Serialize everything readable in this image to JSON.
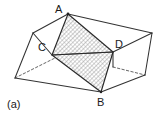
{
  "figure": {
    "panel_label": "(a)",
    "caption_text": "",
    "background_color": "#ffffff",
    "stroke_color": "#333333",
    "hatch_color": "#777777",
    "label_color": "#1a1a1a",
    "width": 160,
    "height": 118,
    "vertex_labels": [
      {
        "id": "A",
        "text": "A",
        "x": 68,
        "y": 14
      },
      {
        "id": "C",
        "text": "C",
        "x": 52,
        "y": 55
      },
      {
        "id": "D",
        "text": "D",
        "x": 113,
        "y": 52
      },
      {
        "id": "B",
        "text": "B",
        "x": 101,
        "y": 92
      }
    ],
    "cross_section": {
      "name": "hatched-quadrilateral-ADBC",
      "vertices": [
        "A",
        "D",
        "B",
        "C"
      ],
      "fill": "diagonal-hatch",
      "hatch_angle_deg": 45,
      "hatch_spacing_px": 3
    },
    "box": {
      "top_left_corner": {
        "x": 33,
        "y": 33
      },
      "top_apex_corner": {
        "x": 68,
        "y": 14
      },
      "top_right_corner": {
        "x": 152,
        "y": 33
      },
      "bottom_left_corner": {
        "x": 15,
        "y": 78
      },
      "bottom_front_corner": {
        "x": 101,
        "y": 92
      },
      "bottom_right_corner": {
        "x": 145,
        "y": 75
      },
      "hidden_edges_style": "dashed"
    }
  }
}
